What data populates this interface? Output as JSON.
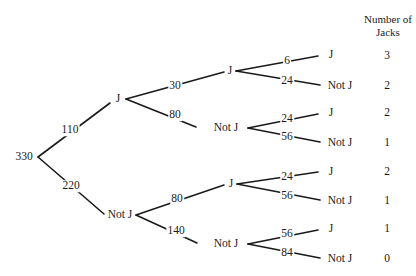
{
  "diagram": {
    "type": "tree",
    "title": "",
    "header": {
      "line1": "Number of",
      "line2": "Jacks"
    },
    "root": {
      "value": "330"
    },
    "level1": [
      {
        "count": "110",
        "node": "J"
      },
      {
        "count": "220",
        "node": "Not J"
      }
    ],
    "level2": [
      {
        "count": "30",
        "node": "J"
      },
      {
        "count": "80",
        "node": "Not J"
      },
      {
        "count": "80",
        "node": "J"
      },
      {
        "count": "140",
        "node": "Not J"
      }
    ],
    "level3": [
      {
        "count": "6",
        "node": "J",
        "jacks": "3"
      },
      {
        "count": "24",
        "node": "Not J",
        "jacks": "2"
      },
      {
        "count": "24",
        "node": "J",
        "jacks": "2"
      },
      {
        "count": "56",
        "node": "Not J",
        "jacks": "1"
      },
      {
        "count": "24",
        "node": "J",
        "jacks": "2"
      },
      {
        "count": "56",
        "node": "Not J",
        "jacks": "1"
      },
      {
        "count": "56",
        "node": "J",
        "jacks": "1"
      },
      {
        "count": "84",
        "node": "Not J",
        "jacks": "0"
      }
    ],
    "line_color": "#1a1a1a",
    "text_color": "#1a1a1a",
    "background": "#ffffff"
  }
}
